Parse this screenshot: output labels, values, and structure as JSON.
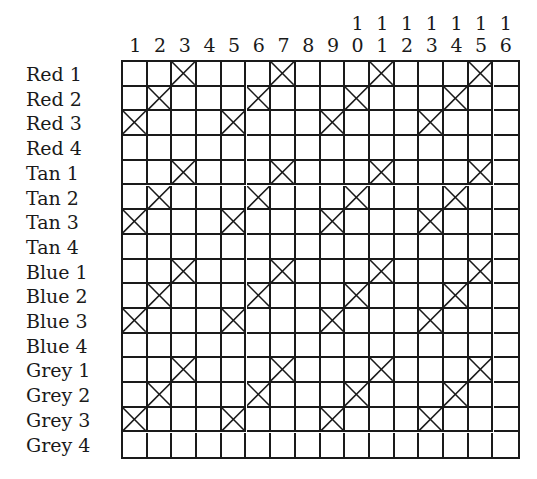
{
  "chart_data": {
    "type": "table",
    "title": "",
    "columns": [
      "1",
      "2",
      "3",
      "4",
      "5",
      "6",
      "7",
      "8",
      "9",
      "10",
      "11",
      "12",
      "13",
      "14",
      "15",
      "16"
    ],
    "rows": [
      {
        "label": "Red 1",
        "marked": [
          3,
          7,
          11,
          15
        ]
      },
      {
        "label": "Red 2",
        "marked": [
          2,
          6,
          10,
          14
        ]
      },
      {
        "label": "Red 3",
        "marked": [
          1,
          5,
          9,
          13
        ]
      },
      {
        "label": "Red 4",
        "marked": []
      },
      {
        "label": "Tan 1",
        "marked": [
          3,
          7,
          11,
          15
        ]
      },
      {
        "label": "Tan 2",
        "marked": [
          2,
          6,
          10,
          14
        ]
      },
      {
        "label": "Tan 3",
        "marked": [
          1,
          5,
          9,
          13
        ]
      },
      {
        "label": "Tan 4",
        "marked": []
      },
      {
        "label": "Blue 1",
        "marked": [
          3,
          7,
          11,
          15
        ]
      },
      {
        "label": "Blue 2",
        "marked": [
          2,
          6,
          10,
          14
        ]
      },
      {
        "label": "Blue 3",
        "marked": [
          1,
          5,
          9,
          13
        ]
      },
      {
        "label": "Blue 4",
        "marked": []
      },
      {
        "label": "Grey 1",
        "marked": [
          3,
          7,
          11,
          15
        ]
      },
      {
        "label": "Grey 2",
        "marked": [
          2,
          6,
          10,
          14
        ]
      },
      {
        "label": "Grey 3",
        "marked": [
          1,
          5,
          9,
          13
        ]
      },
      {
        "label": "Grey 4",
        "marked": []
      }
    ],
    "mark_symbol": "X",
    "grid": true
  },
  "style": {
    "line_color": "#1a1a1a",
    "background": "#ffffff"
  }
}
